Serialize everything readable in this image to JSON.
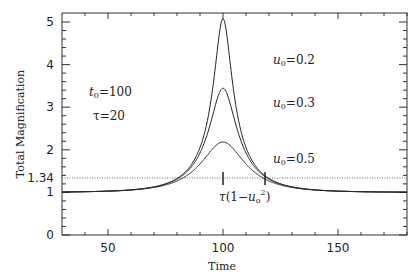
{
  "chart_data": {
    "type": "line",
    "title": "",
    "xlabel": "Time",
    "ylabel": "Total Magnification",
    "xlim": [
      30,
      180
    ],
    "ylim": [
      0,
      5.2
    ],
    "x_ticks": [
      50,
      100,
      150
    ],
    "x_tick_labels": [
      "50",
      "100",
      "150"
    ],
    "y_ticks": [
      0,
      1,
      1.34,
      2,
      3,
      4,
      5
    ],
    "y_tick_labels": [
      "0",
      "1",
      "1.34",
      "2",
      "3",
      "4",
      "5"
    ],
    "grid": false,
    "legend": "none",
    "parameters": {
      "t0": 100,
      "tau": 20
    },
    "series": [
      {
        "name": "u0=0.2",
        "u0": 0.2,
        "peak": 5.08
      },
      {
        "name": "u0=0.3",
        "u0": 0.3,
        "peak": 3.45
      },
      {
        "name": "u0=0.5",
        "u0": 0.5,
        "peak": 2.18
      }
    ],
    "reference_line": {
      "y": 1.34,
      "style": "dotted"
    },
    "annotations": [
      {
        "text": "t0=100",
        "x": 45,
        "y": 3.0
      },
      {
        "text": "τ=20",
        "x": 45,
        "y": 2.55
      },
      {
        "text": "u0=0.2",
        "x": 120,
        "y": 3.05
      },
      {
        "text": "u0=0.3",
        "x": 120,
        "y": 2.55
      },
      {
        "text": "u0=0.5",
        "x": 120,
        "y": 1.68
      },
      {
        "text": "τ(1−u0²)",
        "x": 100,
        "y": 1.0
      }
    ],
    "markers": [
      {
        "x": 100,
        "y": 1.34
      },
      {
        "x": 118.2,
        "y": 1.34
      }
    ]
  },
  "labels": {
    "xlabel": "Time",
    "ylabel": "Total Magnification",
    "t0": "=100",
    "tau": "τ=20",
    "u02": "=0.2",
    "u03": "=0.3",
    "u05": "=0.5",
    "x50": "50",
    "x100": "100",
    "x150": "150",
    "y0": "0",
    "y1": "1",
    "y134": "1.34",
    "y2": "2",
    "y3": "3",
    "y4": "4",
    "y5": "5"
  }
}
